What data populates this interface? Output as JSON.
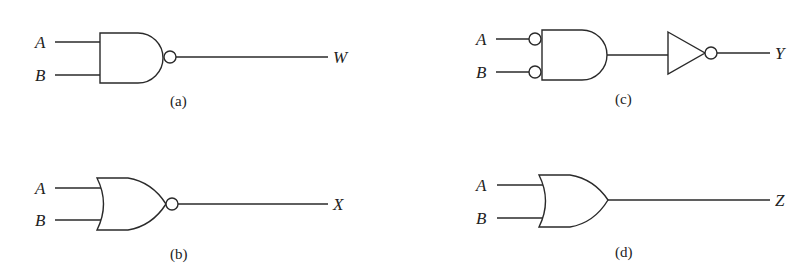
{
  "diagrams": {
    "a": {
      "caption": "(a)",
      "gate_type": "NAND",
      "inputs": [
        "A",
        "B"
      ],
      "output": "W"
    },
    "b": {
      "caption": "(b)",
      "gate_type": "NOR",
      "inputs": [
        "A",
        "B"
      ],
      "output": "X"
    },
    "c": {
      "caption": "(c)",
      "gate_type": "AND with inverted inputs followed by NOT",
      "inputs": [
        "A",
        "B"
      ],
      "output": "Y"
    },
    "d": {
      "caption": "(d)",
      "gate_type": "OR",
      "inputs": [
        "A",
        "B"
      ],
      "output": "Z"
    }
  }
}
